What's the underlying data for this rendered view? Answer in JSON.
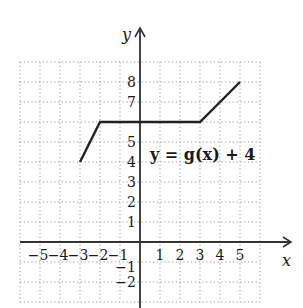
{
  "chart_data": {
    "type": "line",
    "title": "",
    "xlabel": "x",
    "ylabel": "y",
    "xlim": [
      -6,
      6
    ],
    "ylim": [
      -3,
      9
    ],
    "grid": true,
    "grid_style": "dotted",
    "x_ticks": [
      -5,
      -4,
      -3,
      -2,
      -1,
      1,
      2,
      3,
      4,
      5
    ],
    "y_ticks": [
      -2,
      -1,
      1,
      2,
      3,
      4,
      5,
      7,
      8
    ],
    "x_tick_labels": [
      "−5",
      "−4",
      "−3",
      "−2",
      "−1",
      "1",
      "2",
      "3",
      "4",
      "5"
    ],
    "y_tick_labels": [
      "−2",
      "−1",
      "1",
      "2",
      "3",
      "4",
      "5",
      "7",
      "8"
    ],
    "series": [
      {
        "name": "y = g(x) + 4",
        "x": [
          -3,
          -2,
          3,
          5
        ],
        "y": [
          4,
          6,
          6,
          8
        ]
      }
    ],
    "annotations": [
      {
        "text": "y = g(x) + 4",
        "x": 0.4,
        "y": 4.9
      }
    ]
  },
  "labels": {
    "x_axis": "x",
    "y_axis": "y",
    "equation": "y = g(x) + 4"
  },
  "colors": {
    "axis": "#333333",
    "grid": "#9a9a9a",
    "curve": "#222222"
  }
}
